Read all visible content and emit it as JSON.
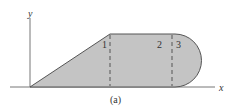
{
  "figure": {
    "caption": "(a)",
    "axes": {
      "x_label": "x",
      "y_label": "y"
    },
    "regions": [
      {
        "id": "1",
        "label": "1"
      },
      {
        "id": "2",
        "label": "2"
      },
      {
        "id": "3",
        "label": "3"
      }
    ],
    "colors": {
      "fill": "#c4c4c4",
      "stroke": "#555555",
      "axis": "#666666"
    }
  }
}
